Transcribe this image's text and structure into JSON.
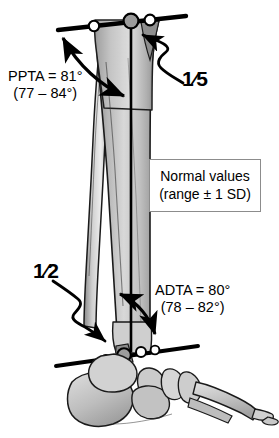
{
  "figure": {
    "background_color": "#ffffff",
    "bone_fill_light": "#e9e9e9",
    "bone_fill_mid": "#c9c9c9",
    "bone_fill_dark": "#9a9a9a",
    "outline_color": "#1a1a1a",
    "marker_fill_white": "#ffffff",
    "marker_fill_gray": "#9c9c9c"
  },
  "annotations": {
    "ppta": {
      "name": "PPTA",
      "value_line": "PPTA = 81°",
      "range_line": "(77 – 84°)"
    },
    "adta": {
      "name": "ADTA",
      "value_line": "ADTA = 80°",
      "range_line": "(78 – 82°)"
    },
    "proximal_fraction": "1⁄5",
    "distal_fraction": "1⁄2"
  },
  "legend_box": {
    "line1": "Normal values",
    "line2": "(range ± 1 SD)",
    "border_color": "#8c8c8c"
  },
  "joint_lines": {
    "proximal_marker_count": 3,
    "distal_marker_count": 4
  }
}
